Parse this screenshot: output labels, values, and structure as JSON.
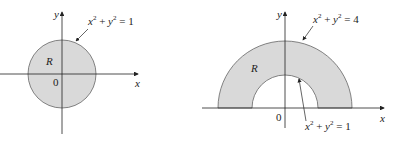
{
  "figures": [
    {
      "id": "disk",
      "region_label": "R",
      "origin_label": "0",
      "x_axis_label": "x",
      "y_axis_label": "y",
      "equation": {
        "base": "x",
        "exp": "2",
        "plus": " + ",
        "base2": "y",
        "exp2": "2",
        "rhs": " = 1"
      },
      "fill_color": "#d9d9d9"
    },
    {
      "id": "half-annulus",
      "region_label": "R",
      "origin_label": "0",
      "x_axis_label": "x",
      "y_axis_label": "y",
      "outer_equation": {
        "base": "x",
        "exp": "2",
        "plus": " + ",
        "base2": "y",
        "exp2": "2",
        "rhs": " = 4"
      },
      "inner_equation": {
        "base": "x",
        "exp": "2",
        "plus": " + ",
        "base2": "y",
        "exp2": "2",
        "rhs": " = 1"
      },
      "fill_color": "#d9d9d9"
    }
  ]
}
